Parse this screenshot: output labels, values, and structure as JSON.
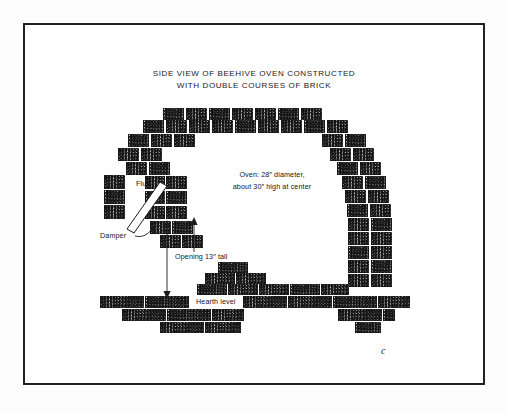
{
  "figure": {
    "title_line1": "SIDE VIEW OF BEEHIVE OVEN CONSTRUCTED",
    "title_line2": "WITH DOUBLE COURSES OF BRICK",
    "signature": "c"
  },
  "annotations": {
    "oven_line1": "Oven:  28″ diameter,",
    "oven_line2": "about 30″ high at center",
    "flue": "Flue",
    "damper": "Damper",
    "opening": "Opening 13″ tall",
    "hearth": "Hearth level"
  },
  "colors": {
    "ink": "#1b1b1b",
    "frame": "#222222",
    "paper": "#ffffff",
    "page": "#fdfdfd",
    "brick_fill": "#efefef"
  },
  "bricks": {
    "dome_left": [
      {
        "x": 104,
        "y": 175,
        "w": 21,
        "h": 14
      },
      {
        "x": 104,
        "y": 190,
        "w": 21,
        "h": 14
      },
      {
        "x": 104,
        "y": 205,
        "w": 21,
        "h": 14
      },
      {
        "x": 126,
        "y": 162,
        "w": 21,
        "h": 13
      },
      {
        "x": 149,
        "y": 162,
        "w": 21,
        "h": 13
      },
      {
        "x": 118,
        "y": 148,
        "w": 21,
        "h": 13
      },
      {
        "x": 141,
        "y": 148,
        "w": 21,
        "h": 13
      },
      {
        "x": 128,
        "y": 134,
        "w": 21,
        "h": 13
      },
      {
        "x": 151,
        "y": 134,
        "w": 21,
        "h": 13
      },
      {
        "x": 174,
        "y": 134,
        "w": 21,
        "h": 13
      },
      {
        "x": 143,
        "y": 120,
        "w": 21,
        "h": 13
      },
      {
        "x": 166,
        "y": 120,
        "w": 21,
        "h": 13
      },
      {
        "x": 189,
        "y": 120,
        "w": 21,
        "h": 13
      },
      {
        "x": 163,
        "y": 108,
        "w": 21,
        "h": 12
      },
      {
        "x": 186,
        "y": 108,
        "w": 21,
        "h": 12
      },
      {
        "x": 166,
        "y": 176,
        "w": 21,
        "h": 13
      },
      {
        "x": 166,
        "y": 191,
        "w": 21,
        "h": 13
      },
      {
        "x": 166,
        "y": 206,
        "w": 21,
        "h": 13
      },
      {
        "x": 145,
        "y": 176,
        "w": 20,
        "h": 13
      },
      {
        "x": 145,
        "y": 191,
        "w": 20,
        "h": 13
      },
      {
        "x": 145,
        "y": 206,
        "w": 20,
        "h": 13
      },
      {
        "x": 150,
        "y": 221,
        "w": 21,
        "h": 13
      },
      {
        "x": 172,
        "y": 221,
        "w": 21,
        "h": 13
      },
      {
        "x": 160,
        "y": 235,
        "w": 21,
        "h": 13
      },
      {
        "x": 182,
        "y": 235,
        "w": 21,
        "h": 13
      }
    ],
    "dome_top": [
      {
        "x": 209,
        "y": 108,
        "w": 21,
        "h": 12
      },
      {
        "x": 232,
        "y": 108,
        "w": 21,
        "h": 12
      },
      {
        "x": 255,
        "y": 108,
        "w": 21,
        "h": 12
      },
      {
        "x": 278,
        "y": 108,
        "w": 21,
        "h": 12
      },
      {
        "x": 301,
        "y": 108,
        "w": 21,
        "h": 12
      },
      {
        "x": 212,
        "y": 120,
        "w": 21,
        "h": 13
      },
      {
        "x": 235,
        "y": 120,
        "w": 21,
        "h": 13
      },
      {
        "x": 258,
        "y": 120,
        "w": 21,
        "h": 13
      },
      {
        "x": 281,
        "y": 120,
        "w": 21,
        "h": 13
      },
      {
        "x": 304,
        "y": 120,
        "w": 21,
        "h": 13
      }
    ],
    "dome_right": [
      {
        "x": 327,
        "y": 120,
        "w": 21,
        "h": 13
      },
      {
        "x": 322,
        "y": 134,
        "w": 21,
        "h": 13
      },
      {
        "x": 345,
        "y": 134,
        "w": 21,
        "h": 13
      },
      {
        "x": 330,
        "y": 148,
        "w": 21,
        "h": 13
      },
      {
        "x": 353,
        "y": 148,
        "w": 21,
        "h": 13
      },
      {
        "x": 337,
        "y": 162,
        "w": 21,
        "h": 13
      },
      {
        "x": 360,
        "y": 162,
        "w": 21,
        "h": 13
      },
      {
        "x": 342,
        "y": 176,
        "w": 21,
        "h": 13
      },
      {
        "x": 365,
        "y": 176,
        "w": 21,
        "h": 13
      },
      {
        "x": 345,
        "y": 190,
        "w": 21,
        "h": 13
      },
      {
        "x": 368,
        "y": 190,
        "w": 21,
        "h": 13
      },
      {
        "x": 347,
        "y": 204,
        "w": 21,
        "h": 13
      },
      {
        "x": 370,
        "y": 204,
        "w": 21,
        "h": 13
      },
      {
        "x": 348,
        "y": 218,
        "w": 21,
        "h": 13
      },
      {
        "x": 371,
        "y": 218,
        "w": 21,
        "h": 13
      },
      {
        "x": 348,
        "y": 232,
        "w": 21,
        "h": 13
      },
      {
        "x": 371,
        "y": 232,
        "w": 21,
        "h": 13
      },
      {
        "x": 348,
        "y": 246,
        "w": 21,
        "h": 13
      },
      {
        "x": 371,
        "y": 246,
        "w": 21,
        "h": 13
      },
      {
        "x": 348,
        "y": 260,
        "w": 21,
        "h": 13
      },
      {
        "x": 371,
        "y": 260,
        "w": 21,
        "h": 13
      },
      {
        "x": 348,
        "y": 274,
        "w": 21,
        "h": 13
      },
      {
        "x": 371,
        "y": 274,
        "w": 21,
        "h": 13
      }
    ],
    "mouth_slope": [
      {
        "x": 218,
        "y": 262,
        "w": 30,
        "h": 11
      },
      {
        "x": 205,
        "y": 273,
        "w": 30,
        "h": 11
      },
      {
        "x": 236,
        "y": 273,
        "w": 30,
        "h": 11
      },
      {
        "x": 197,
        "y": 284,
        "w": 30,
        "h": 11
      },
      {
        "x": 228,
        "y": 284,
        "w": 30,
        "h": 11
      },
      {
        "x": 259,
        "y": 284,
        "w": 30,
        "h": 11
      },
      {
        "x": 290,
        "y": 284,
        "w": 30,
        "h": 11
      },
      {
        "x": 321,
        "y": 284,
        "w": 28,
        "h": 11
      }
    ],
    "hearth_rows": [
      {
        "x": 100,
        "y": 296,
        "w": 44,
        "h": 12
      },
      {
        "x": 145,
        "y": 296,
        "w": 44,
        "h": 12
      },
      {
        "x": 243,
        "y": 296,
        "w": 44,
        "h": 12
      },
      {
        "x": 288,
        "y": 296,
        "w": 44,
        "h": 12
      },
      {
        "x": 333,
        "y": 296,
        "w": 44,
        "h": 12
      },
      {
        "x": 378,
        "y": 296,
        "w": 32,
        "h": 12
      },
      {
        "x": 122,
        "y": 309,
        "w": 44,
        "h": 12
      },
      {
        "x": 167,
        "y": 309,
        "w": 44,
        "h": 12
      },
      {
        "x": 212,
        "y": 309,
        "w": 32,
        "h": 12
      },
      {
        "x": 338,
        "y": 309,
        "w": 44,
        "h": 12
      },
      {
        "x": 383,
        "y": 309,
        "w": 12,
        "h": 12
      },
      {
        "x": 160,
        "y": 322,
        "w": 44,
        "h": 11
      },
      {
        "x": 205,
        "y": 322,
        "w": 36,
        "h": 11
      },
      {
        "x": 355,
        "y": 322,
        "w": 26,
        "h": 11
      }
    ]
  }
}
